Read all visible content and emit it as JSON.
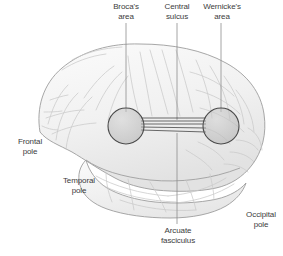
{
  "figure": {
    "background_color": "#ffffff",
    "brain_fill": "#f2f2f2",
    "brain_outline_color": "#9a9a9a",
    "sulci_color": "#c8c8c8",
    "marker_fill": "#b9b9b9",
    "marker_outline": "#4a4a4a",
    "fiber_color": "#2e2e2e",
    "leader_color": "#8d8d8d",
    "text_color": "#3c3c3c"
  },
  "labels": {
    "brocas_area": "Broca's\narea",
    "central_sulcus": "Central\nsulcus",
    "wernickes_area": "Wernicke's\narea",
    "frontal_pole": "Frontal\npole",
    "temporal_pole": "Temporal\npole",
    "arcuate_fasciculus": "Arcuate\nfasciculus",
    "occipital_pole": "Occipital\npole"
  },
  "annotations": [
    {
      "id": "brocas-area",
      "text": "Broca's\narea",
      "label_x": 104,
      "label_y": 2,
      "label_width": 44,
      "leader": {
        "x1": 126,
        "y1": 23,
        "x2": 126,
        "y2": 112
      },
      "marker": {
        "cx": 126,
        "cy": 126,
        "r": 18
      }
    },
    {
      "id": "central-sulcus",
      "text": "Central\nsulcus",
      "label_x": 155,
      "label_y": 2,
      "label_width": 44,
      "leader": {
        "x1": 177,
        "y1": 23,
        "x2": 177,
        "y2": 120
      }
    },
    {
      "id": "wernickes-area",
      "text": "Wernicke's\narea",
      "label_x": 196,
      "label_y": 2,
      "label_width": 52,
      "leader": {
        "x1": 221,
        "y1": 23,
        "x2": 221,
        "y2": 112
      },
      "marker": {
        "cx": 221,
        "cy": 126,
        "r": 18
      }
    },
    {
      "id": "frontal-pole",
      "text": "Frontal\npole",
      "label_x": 8,
      "label_y": 137,
      "label_width": 44
    },
    {
      "id": "temporal-pole",
      "text": "Temporal\npole",
      "label_x": 53,
      "label_y": 176,
      "label_width": 52
    },
    {
      "id": "arcuate-fasciculus",
      "text": "Arcuate\nfasciculus",
      "label_x": 152,
      "label_y": 226,
      "label_width": 52,
      "leader": {
        "x1": 177,
        "y1": 133,
        "x2": 177,
        "y2": 224
      }
    },
    {
      "id": "occipital-pole",
      "text": "Occipital\npole",
      "label_x": 238,
      "label_y": 210,
      "label_width": 46
    }
  ],
  "fiber_bundle": {
    "name": "arcuate fasciculus fibers",
    "line_count": 5,
    "from_x": 141,
    "to_x": 206,
    "y_values": [
      118,
      121,
      124,
      127,
      130
    ]
  }
}
